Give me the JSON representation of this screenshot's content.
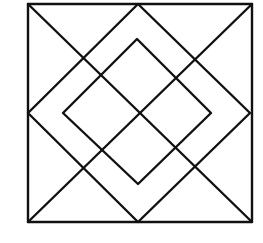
{
  "figure": {
    "stroke_color": "#111111",
    "background_color": "#ffffff",
    "stroke_width": 2.4,
    "outer_square": {
      "x1": 28,
      "y1": 4,
      "x2": 252,
      "y2": 222
    },
    "diagonals": [
      {
        "x1": 28,
        "y1": 4,
        "x2": 252,
        "y2": 222
      },
      {
        "x1": 252,
        "y1": 4,
        "x2": 28,
        "y2": 222
      }
    ],
    "mid_diamond": "138,4 250,113 138,222 28,113",
    "inner_diamond": "137,39 211,113 138,184 63,113"
  }
}
